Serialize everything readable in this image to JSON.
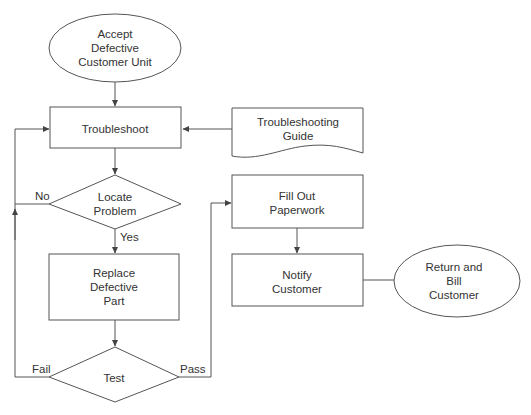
{
  "diagram": {
    "type": "flowchart",
    "colors": {
      "stroke": "#555555",
      "text": "#333333",
      "background": "#ffffff"
    },
    "nodes": {
      "accept": {
        "shape": "ellipse",
        "lines": [
          "Accept",
          "Defective",
          "Customer Unit"
        ]
      },
      "troubleshoot": {
        "shape": "process",
        "lines": [
          "Troubleshoot"
        ]
      },
      "guide": {
        "shape": "document",
        "lines": [
          "Troubleshooting",
          "Guide"
        ]
      },
      "locate": {
        "shape": "decision",
        "lines": [
          "Locate",
          "Problem"
        ]
      },
      "replace": {
        "shape": "process",
        "lines": [
          "Replace",
          "Defective",
          "Part"
        ]
      },
      "test": {
        "shape": "decision",
        "lines": [
          "Test"
        ]
      },
      "fillout": {
        "shape": "process",
        "lines": [
          "Fill Out",
          "Paperwork"
        ]
      },
      "notify": {
        "shape": "process",
        "lines": [
          "Notify",
          "Customer"
        ]
      },
      "returnbill": {
        "shape": "ellipse",
        "lines": [
          "Return and",
          "Bill",
          "Customer"
        ]
      }
    },
    "edge_labels": {
      "no": "No",
      "yes": "Yes",
      "fail": "Fail",
      "pass": "Pass"
    },
    "edges": [
      {
        "from": "accept",
        "to": "troubleshoot"
      },
      {
        "from": "guide",
        "to": "troubleshoot"
      },
      {
        "from": "troubleshoot",
        "to": "locate"
      },
      {
        "from": "locate",
        "to": "troubleshoot",
        "label": "No"
      },
      {
        "from": "locate",
        "to": "replace",
        "label": "Yes"
      },
      {
        "from": "replace",
        "to": "test"
      },
      {
        "from": "test",
        "to": "troubleshoot",
        "label": "Fail"
      },
      {
        "from": "test",
        "to": "fillout",
        "label": "Pass"
      },
      {
        "from": "fillout",
        "to": "notify"
      },
      {
        "from": "notify",
        "to": "returnbill"
      }
    ]
  }
}
